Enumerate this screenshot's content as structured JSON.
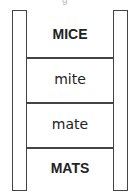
{
  "partial_top_text": "g",
  "ladder": {
    "rungs": [
      {
        "word": "MICE",
        "style": "bold"
      },
      {
        "word": "mite",
        "style": "light"
      },
      {
        "word": "mate",
        "style": "light"
      },
      {
        "word": "MATS",
        "style": "bold"
      }
    ]
  }
}
